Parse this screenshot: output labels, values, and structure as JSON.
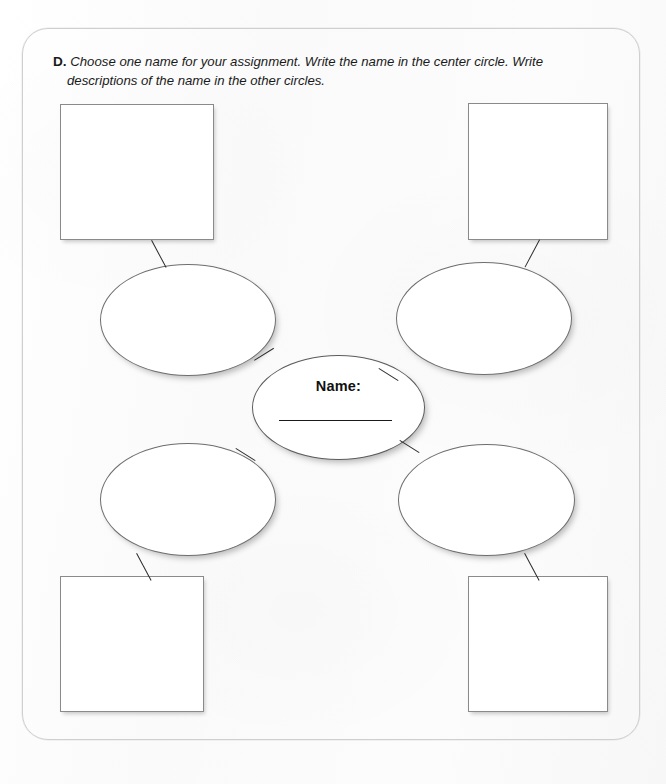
{
  "worksheet": {
    "instruction": {
      "label": "D.",
      "line1": "Choose one name for your assignment. Write the name in the center circle. Write",
      "line2": "descriptions of the name in the other circles."
    },
    "center_node": {
      "label": "Name:",
      "answer_value": ""
    },
    "description_circles": [
      {
        "id": "upper-left",
        "value": ""
      },
      {
        "id": "upper-right",
        "value": ""
      },
      {
        "id": "lower-left",
        "value": ""
      },
      {
        "id": "lower-right",
        "value": ""
      }
    ],
    "detail_boxes": [
      {
        "id": "top-left",
        "value": ""
      },
      {
        "id": "top-right",
        "value": ""
      },
      {
        "id": "bottom-left",
        "value": ""
      },
      {
        "id": "bottom-right",
        "value": ""
      }
    ],
    "colors": {
      "page_background": "#fbfbfb",
      "frame_border": "#cfcfcf",
      "box_border": "#8a8a8a",
      "ellipse_border": "#6e6e6e",
      "connector": "#2b2b2b",
      "text": "#1a1a1a"
    }
  }
}
